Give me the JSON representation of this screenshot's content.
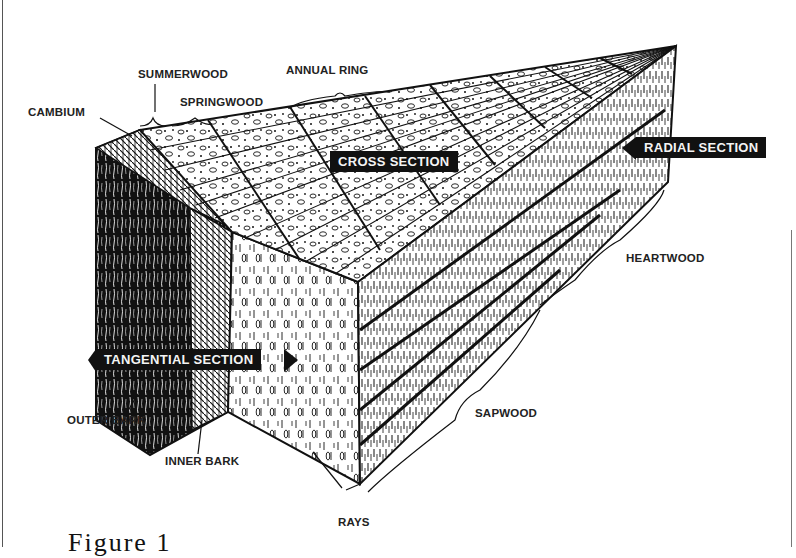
{
  "figure": {
    "caption": "Figure 1"
  },
  "labels": {
    "summerwood": "SUMMERWOOD",
    "annual_ring": "ANNUAL RING",
    "springwood": "SPRINGWOOD",
    "cambium": "CAMBIUM",
    "heartwood": "HEARTWOOD",
    "sapwood": "SAPWOOD",
    "outer_bark": "OUTER BARK",
    "inner_bark": "INNER BARK",
    "rays": "RAYS"
  },
  "section_tags": {
    "cross": "CROSS SECTION",
    "radial": "RADIAL SECTION",
    "tangential": "TANGENTIAL SECTION"
  },
  "colors": {
    "ink": "#111111",
    "paper": "#ffffff",
    "label": "#222222"
  }
}
